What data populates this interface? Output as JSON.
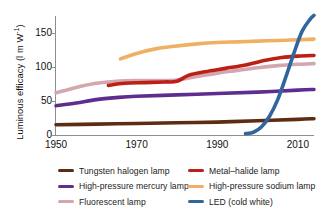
{
  "chart_data": {
    "type": "line",
    "title": "",
    "xlabel": "",
    "ylabel": "Luminous efficacy (l m W",
    "ylabel_exponent": "-1",
    "ylabel_close": ")",
    "xlim": [
      1950,
      2014
    ],
    "ylim": [
      0,
      175
    ],
    "xticks": [
      1950,
      1970,
      1990,
      2010
    ],
    "yticks": [
      0,
      50,
      100,
      150
    ],
    "grid": false,
    "legend_position": "bottom",
    "series": [
      {
        "name": "Tungsten halogen lamp",
        "color": "#5c2d12",
        "points": [
          [
            1950,
            15
          ],
          [
            1960,
            16
          ],
          [
            1970,
            17
          ],
          [
            1980,
            18
          ],
          [
            1990,
            19
          ],
          [
            2000,
            21
          ],
          [
            2010,
            23
          ],
          [
            2014,
            24
          ]
        ]
      },
      {
        "name": "High-pressure mercury lamp",
        "color": "#5e2d8f",
        "points": [
          [
            1950,
            43
          ],
          [
            1955,
            47
          ],
          [
            1960,
            52
          ],
          [
            1965,
            55
          ],
          [
            1970,
            57
          ],
          [
            1980,
            59
          ],
          [
            1990,
            61
          ],
          [
            2000,
            63
          ],
          [
            2010,
            66
          ],
          [
            2014,
            67
          ]
        ]
      },
      {
        "name": "Fluorescent lamp",
        "color": "#d4a6ae",
        "points": [
          [
            1950,
            62
          ],
          [
            1955,
            70
          ],
          [
            1960,
            76
          ],
          [
            1965,
            79
          ],
          [
            1970,
            80
          ],
          [
            1975,
            80
          ],
          [
            1980,
            81
          ],
          [
            1985,
            86
          ],
          [
            1990,
            91
          ],
          [
            1995,
            95
          ],
          [
            2000,
            99
          ],
          [
            2005,
            102
          ],
          [
            2010,
            104
          ],
          [
            2014,
            105
          ]
        ]
      },
      {
        "name": "Metal-halide lamp",
        "color": "#bb1f16",
        "points": [
          [
            1963,
            73
          ],
          [
            1967,
            76
          ],
          [
            1972,
            77
          ],
          [
            1977,
            78
          ],
          [
            1980,
            79
          ],
          [
            1983,
            88
          ],
          [
            1987,
            93
          ],
          [
            1992,
            98
          ],
          [
            1997,
            103
          ],
          [
            2002,
            110
          ],
          [
            2006,
            114
          ],
          [
            2010,
            116
          ],
          [
            2014,
            117
          ]
        ]
      },
      {
        "name": "High-pressure sodium lamp",
        "color": "#f0b063",
        "points": [
          [
            1966,
            112
          ],
          [
            1970,
            120
          ],
          [
            1975,
            127
          ],
          [
            1980,
            131
          ],
          [
            1985,
            134
          ],
          [
            1990,
            136
          ],
          [
            1995,
            137
          ],
          [
            2000,
            138
          ],
          [
            2005,
            139
          ],
          [
            2010,
            140
          ],
          [
            2014,
            141
          ]
        ]
      },
      {
        "name": "LED (cold white)",
        "color": "#31659e",
        "points": [
          [
            1997,
            2
          ],
          [
            1999,
            4
          ],
          [
            2001,
            12
          ],
          [
            2003,
            28
          ],
          [
            2005,
            52
          ],
          [
            2007,
            85
          ],
          [
            2009,
            120
          ],
          [
            2011,
            152
          ],
          [
            2013,
            170
          ],
          [
            2014,
            176
          ]
        ]
      }
    ]
  },
  "legend": {
    "left_column": [
      {
        "label": "Tungsten halogen lamp",
        "color": "#5c2d12"
      },
      {
        "label": "High-pressure mercury lamp",
        "color": "#5e2d8f"
      },
      {
        "label": "Fluorescent lamp",
        "color": "#d4a6ae"
      }
    ],
    "right_column": [
      {
        "label": "Metal–halide lamp",
        "color": "#bb1f16"
      },
      {
        "label": "High-pressure sodium lamp",
        "color": "#f0b063"
      },
      {
        "label": "LED (cold white)",
        "color": "#31659e"
      }
    ]
  },
  "axis_colors": {
    "spine": "#8e8e8e",
    "text": "#111111"
  }
}
